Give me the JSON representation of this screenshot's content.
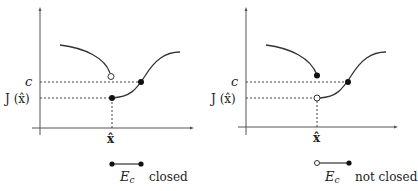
{
  "panels": [
    {
      "id": "left",
      "y_tick_c": "c",
      "y_tick_J": "J (x̂)",
      "x_tick": "x̂",
      "set_label": "E",
      "set_subscript": "c",
      "status": "closed"
    },
    {
      "id": "right",
      "y_tick_c": "c",
      "y_tick_J": "J (x̂)",
      "x_tick": "x̂",
      "set_label": "E",
      "set_subscript": "c",
      "status": "not closed"
    }
  ],
  "colors": {
    "line": "#333333",
    "dashed": "#444444",
    "axis": "#555555"
  }
}
